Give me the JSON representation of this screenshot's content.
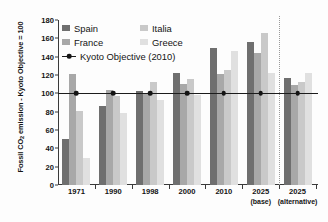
{
  "chart_data": {
    "type": "bar",
    "title": "",
    "subtitle": "",
    "xlabel": "",
    "ylabel": "Fossil CO2 emission - Kyoto Objective = 100",
    "ylabel_prefix": "Fossil CO",
    "ylabel_sub": "2",
    "ylabel_suffix": " emission - Kyoto Objective = 100",
    "ylim": [
      0,
      180
    ],
    "ytick_step": 20,
    "yticks": [
      0,
      20,
      40,
      60,
      80,
      100,
      120,
      140,
      160,
      180
    ],
    "grid": false,
    "legend_position": "top-left inside plot",
    "categories": [
      "1971",
      "1990",
      "1998",
      "2000",
      "2010",
      "2025",
      "2025"
    ],
    "category_qualifiers": [
      "",
      "",
      "",
      "",
      "",
      "(base)",
      "(alternative)"
    ],
    "series": [
      {
        "name": "Spain",
        "color": "#6f6f6f",
        "values": [
          50,
          86,
          103,
          122,
          149,
          156,
          117
        ]
      },
      {
        "name": "France",
        "color": "#a8a8a8",
        "values": [
          121,
          104,
          100,
          110,
          121,
          144,
          109
        ]
      },
      {
        "name": "Italia",
        "color": "#c9c9c9",
        "values": [
          81,
          97,
          112,
          116,
          126,
          166,
          112
        ]
      },
      {
        "name": "Greece",
        "color": "#e0e0e0",
        "values": [
          29,
          79,
          93,
          98,
          146,
          122,
          122
        ]
      }
    ],
    "reference_line": {
      "name": "Kyoto Objective (2010)",
      "value": 100,
      "color": "#141414",
      "marker": "circle"
    },
    "annotations": [
      {
        "name": "scenario-divider",
        "type": "vertical-dotted-line",
        "between": [
          "2025 (base)",
          "2025 (alternative)"
        ]
      }
    ]
  },
  "legend": {
    "entries": [
      {
        "label": "Spain",
        "swatch": "#6f6f6f"
      },
      {
        "label": "Italia",
        "swatch": "#c9c9c9"
      },
      {
        "label": "France",
        "swatch": "#a8a8a8"
      },
      {
        "label": "Greece",
        "swatch": "#e0e0e0"
      }
    ],
    "line_entry": {
      "label": "Kyoto Objective (2010)"
    }
  }
}
